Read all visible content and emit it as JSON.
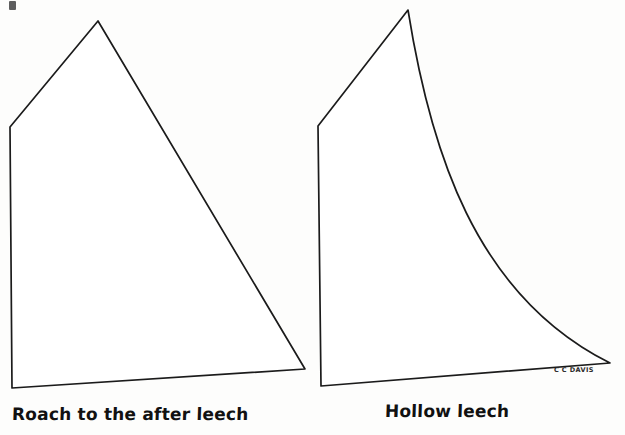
{
  "figure": {
    "background_color": "#fdfdfc",
    "ink_color": "#1b1b1b",
    "signature": "C C DAVIS"
  },
  "diagrams": [
    {
      "id": "roach-sail",
      "caption": "Roach to the after leech",
      "leech_type": "convex",
      "description": "Sail outline whose after leech is straight to slightly convex, adding area outside the straight line from head to clew",
      "points": {
        "peak": [
          98,
          21
        ],
        "throat": [
          10,
          127
        ],
        "tack": [
          12,
          388
        ],
        "clew": [
          305,
          369
        ]
      }
    },
    {
      "id": "hollow-sail",
      "caption": "Hollow leech",
      "leech_type": "concave",
      "description": "Sail outline whose after leech curves inward, cutting area away from the straight line from head to clew",
      "points": {
        "peak": [
          408,
          10
        ],
        "throat": [
          318,
          126
        ],
        "tack": [
          321,
          386
        ],
        "clew": [
          610,
          363
        ]
      },
      "leech_curve_control": [
        466,
        182
      ]
    }
  ],
  "artifacts": {
    "top_left_mark": "scan-speck"
  }
}
